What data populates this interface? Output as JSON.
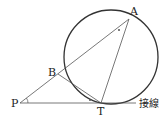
{
  "diagram": {
    "points": {
      "A": {
        "label": "A"
      },
      "B": {
        "label": "B"
      },
      "P": {
        "label": "P"
      },
      "T": {
        "label": "T"
      }
    },
    "tangent_label": "接線",
    "angle_mark": "∘"
  }
}
